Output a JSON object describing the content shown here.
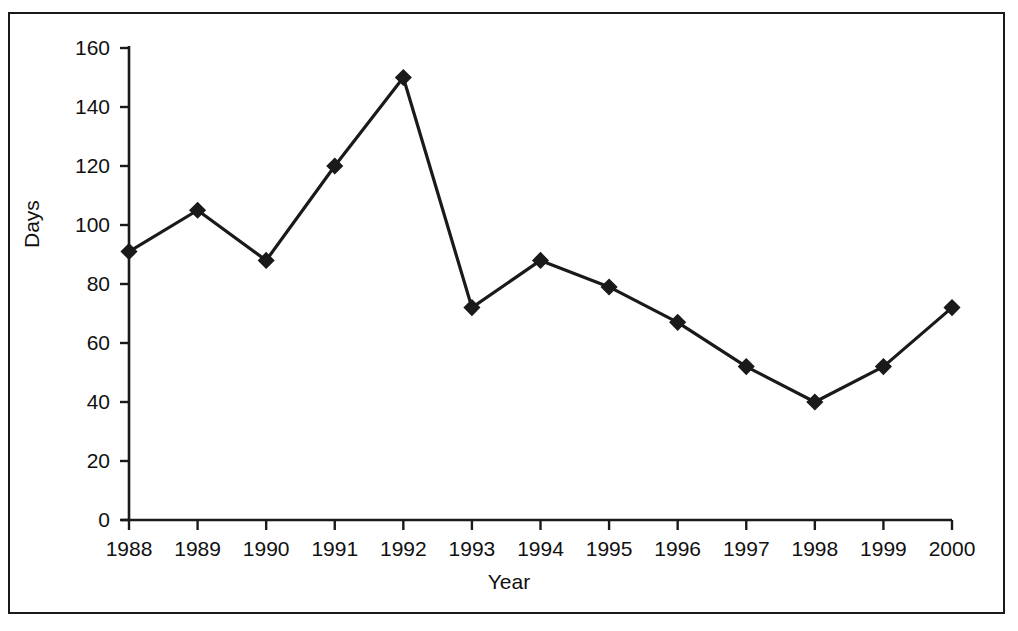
{
  "chart_data": {
    "type": "line",
    "title": "",
    "xlabel": "Year",
    "ylabel": "Days",
    "categories": [
      "1988",
      "1989",
      "1990",
      "1991",
      "1992",
      "1993",
      "1994",
      "1995",
      "1996",
      "1997",
      "1998",
      "1999",
      "2000"
    ],
    "values": [
      91,
      105,
      88,
      120,
      150,
      72,
      88,
      79,
      67,
      52,
      40,
      52,
      72
    ],
    "series": [
      {
        "name": "Days",
        "values": [
          91,
          105,
          88,
          120,
          150,
          72,
          88,
          79,
          67,
          52,
          40,
          52,
          72
        ]
      }
    ],
    "ylim": [
      0,
      160
    ],
    "yticks": [
      0,
      20,
      40,
      60,
      80,
      100,
      120,
      140,
      160
    ],
    "ytick_labels": [
      "0",
      "20",
      "40",
      "60",
      "80",
      "100",
      "120",
      "140",
      "160"
    ],
    "xtick_labels": [
      "1988",
      "1989",
      "1990",
      "1991",
      "1992",
      "1993",
      "1994",
      "1995",
      "1996",
      "1997",
      "1998",
      "1999",
      "2000"
    ],
    "grid": false,
    "legend": false,
    "legend_position": "none",
    "marker": "diamond",
    "line_color": "#1a1a1a",
    "marker_color": "#1a1a1a",
    "axis_color": "#1a1a1a",
    "background_color": "#ffffff",
    "border_color": "#1a1a1a"
  },
  "figure": {
    "border_color": "#1a1a1a",
    "background": "#ffffff"
  }
}
